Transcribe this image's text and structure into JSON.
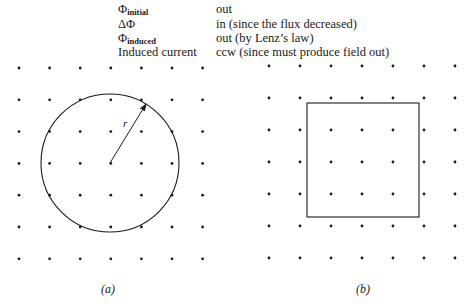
{
  "table": {
    "rows": [
      {
        "symbol": "Φ",
        "subscript": "initial",
        "value": "out"
      },
      {
        "symbol": "ΔΦ",
        "subscript": "",
        "value": "in (since the flux decreased)"
      },
      {
        "symbol": "Φ",
        "subscript": "induced",
        "value": "out (by Lenz’s law)"
      },
      {
        "symbol": "Induced current",
        "subscript": "",
        "value": "ccw (since must produce field out)"
      }
    ]
  },
  "figure_a": {
    "caption": "(a)",
    "radius_label": "r",
    "shape": "circle",
    "field_grid": {
      "rows": 7,
      "cols": 7,
      "direction": "out-of-page"
    }
  },
  "figure_b": {
    "caption": "(b)",
    "shape": "square",
    "field_grid": {
      "rows": 7,
      "cols": 7,
      "direction": "out-of-page"
    }
  },
  "colors": {
    "ink": "#1a1a1a",
    "background": "#ffffff"
  }
}
